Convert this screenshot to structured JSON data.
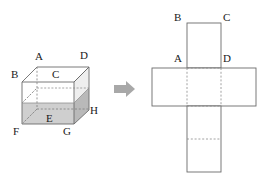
{
  "figure": {
    "background": "#ffffff",
    "stroke_color": "#6b6b6b",
    "dashed_color": "#8a8a8a",
    "label_color": "#1a1a1a",
    "shade_color": "#c9c9c9",
    "shade_color_dark": "#b5b5b5",
    "shade_color_light": "#dedede",
    "arrow_color": "#a8a8a8"
  },
  "cube": {
    "name": "labelled-cube",
    "vertices": [
      {
        "id": "A",
        "label": "A",
        "x": 38,
        "y": 57
      },
      {
        "id": "D",
        "label": "D",
        "x": 83,
        "y": 56
      },
      {
        "id": "B",
        "label": "B",
        "x": 16,
        "y": 74
      },
      {
        "id": "C",
        "label": "C",
        "x": 56,
        "y": 74
      },
      {
        "id": "H",
        "label": "H",
        "x": 92,
        "y": 111
      },
      {
        "id": "E",
        "label": "E",
        "x": 50,
        "y": 119
      },
      {
        "id": "F",
        "label": "F",
        "x": 15,
        "y": 131
      },
      {
        "id": "G",
        "label": "G",
        "x": 65,
        "y": 131
      }
    ]
  },
  "arrow": {
    "name": "transform-arrow",
    "direction": "right",
    "x": 114,
    "y": 82
  },
  "net": {
    "name": "cube-net-cross",
    "labels": [
      {
        "id": "B",
        "label": "B",
        "x": 175,
        "y": 12
      },
      {
        "id": "C",
        "label": "C",
        "x": 222,
        "y": 12
      },
      {
        "id": "A",
        "label": "A",
        "x": 174,
        "y": 53
      },
      {
        "id": "D",
        "label": "D",
        "x": 222,
        "y": 53
      }
    ],
    "panels": [
      {
        "name": "top-square",
        "x": 187,
        "y": 23,
        "w": 34,
        "h": 45
      },
      {
        "name": "middle-strip",
        "x": 152,
        "y": 68,
        "w": 104,
        "h": 38
      },
      {
        "name": "bottom-strip",
        "x": 187,
        "y": 106,
        "w": 34,
        "h": 66
      }
    ],
    "fold_lines": [
      {
        "name": "fold-top-square-bottom",
        "x1": 187,
        "y1": 68,
        "x2": 221,
        "y2": 68
      },
      {
        "name": "fold-left-vertical",
        "x1": 187,
        "y1": 68,
        "x2": 187,
        "y2": 106
      },
      {
        "name": "fold-right-vertical",
        "x1": 221,
        "y1": 68,
        "x2": 221,
        "y2": 106
      },
      {
        "name": "fold-middle-bottom",
        "x1": 187,
        "y1": 106,
        "x2": 221,
        "y2": 106
      },
      {
        "name": "fold-bottom-mid",
        "x1": 187,
        "y1": 139,
        "x2": 221,
        "y2": 139
      }
    ]
  }
}
